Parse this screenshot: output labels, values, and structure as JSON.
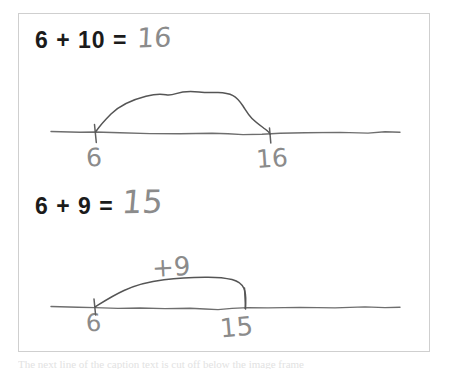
{
  "page": {
    "kind": "handwritten-math-worksheet-scan",
    "background_color": "#ffffff",
    "frame_color": "#cfcfcf",
    "printed_ink_color": "#1b1b1b",
    "pencil_ink_color": "#8b8b8b"
  },
  "problems": [
    {
      "id": "problem-1",
      "printed_equation": "6 + 10 =",
      "handwritten_answer": "16",
      "numberline": {
        "start_label": "6",
        "end_label": "16",
        "jump_label": "",
        "start_value": 6,
        "end_value": 16,
        "jump_size": 10
      }
    },
    {
      "id": "problem-2",
      "printed_equation": "6 + 9 =",
      "handwritten_answer": "15",
      "numberline": {
        "start_label": "6",
        "end_label": "15",
        "jump_label": "+9",
        "start_value": 6,
        "end_value": 15,
        "jump_size": 9
      }
    }
  ],
  "bottom_sliver": {
    "text": "The next line of the caption text is cut off below the image frame"
  }
}
